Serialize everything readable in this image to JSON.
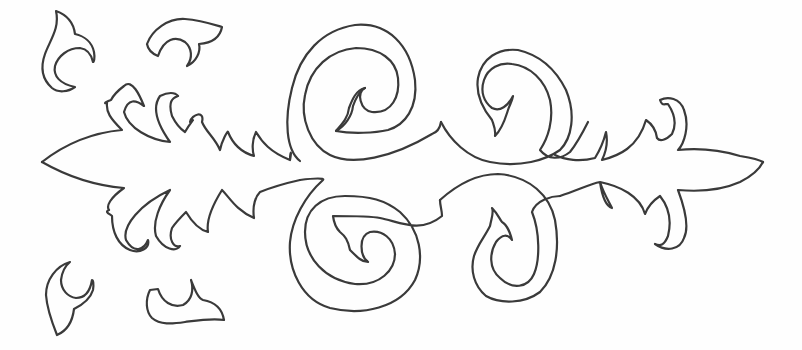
{
  "image": {
    "title": "",
    "description": "Hand-drawn symmetrical ornamental scroll pattern (line art, black outline on white)",
    "colors": {
      "background": "#fefefe",
      "stroke": "#3a3a3a"
    },
    "elements": {
      "central_ornament": "Horizontal ornamental band with pointed tips on left and right, four spirals in the middle",
      "spirals": [
        "upper-left spiral",
        "upper-right spiral",
        "lower-left spiral",
        "lower-right spiral"
      ],
      "loose_fragments": [
        "top-left leaf A",
        "top-left leaf B",
        "bottom-left leaf A",
        "bottom-left leaf B"
      ]
    }
  }
}
